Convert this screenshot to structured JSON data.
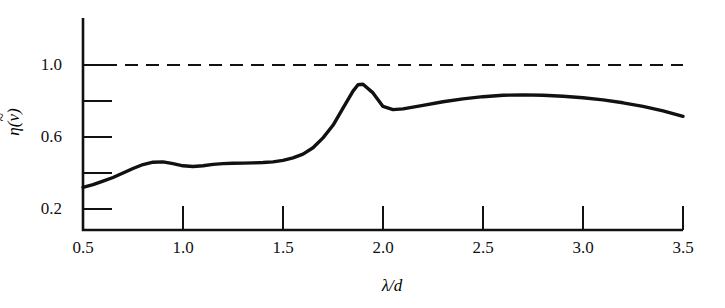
{
  "chart_data": {
    "type": "line",
    "title": "",
    "xlabel": "λ/d",
    "ylabel": "η(ν̃)",
    "xlim": [
      0.5,
      3.5
    ],
    "ylim": [
      0.09,
      1.12
    ],
    "grid": false,
    "legend": null,
    "xticks": [
      0.5,
      1.0,
      1.5,
      2.0,
      2.5,
      3.0,
      3.5
    ],
    "xtick_labels": [
      "0.5",
      "1.0",
      "1.5",
      "2.0",
      "2.5",
      "3.0",
      "3.5"
    ],
    "yticks": [
      0.2,
      0.4,
      0.6,
      0.8,
      1.0
    ],
    "ytick_labels": [
      "0.2",
      "",
      "0.6",
      "",
      "1.0"
    ],
    "ytick_labels_shown": [
      "0.2",
      "0.6",
      "1.0"
    ],
    "series": [
      {
        "name": "efficiency",
        "style": "solid",
        "color": "#111111",
        "x": [
          0.5,
          0.55,
          0.6,
          0.65,
          0.7,
          0.75,
          0.8,
          0.85,
          0.9,
          0.95,
          1.0,
          1.05,
          1.1,
          1.15,
          1.2,
          1.25,
          1.3,
          1.35,
          1.4,
          1.45,
          1.5,
          1.55,
          1.6,
          1.65,
          1.7,
          1.75,
          1.8,
          1.85,
          1.875,
          1.9,
          1.95,
          2.0,
          2.05,
          2.1,
          2.2,
          2.3,
          2.4,
          2.5,
          2.6,
          2.7,
          2.8,
          2.9,
          3.0,
          3.1,
          3.2,
          3.3,
          3.4,
          3.5
        ],
        "y": [
          0.32,
          0.335,
          0.355,
          0.375,
          0.4,
          0.425,
          0.447,
          0.46,
          0.462,
          0.452,
          0.44,
          0.436,
          0.44,
          0.448,
          0.452,
          0.454,
          0.455,
          0.456,
          0.458,
          0.462,
          0.47,
          0.484,
          0.505,
          0.54,
          0.595,
          0.665,
          0.76,
          0.855,
          0.89,
          0.893,
          0.845,
          0.77,
          0.752,
          0.756,
          0.776,
          0.796,
          0.812,
          0.824,
          0.832,
          0.834,
          0.832,
          0.826,
          0.818,
          0.806,
          0.79,
          0.77,
          0.745,
          0.715
        ]
      },
      {
        "name": "unity-reference",
        "style": "dashed",
        "color": "#111111",
        "x": [
          0.5,
          3.5
        ],
        "y": [
          1.0,
          1.0
        ]
      }
    ],
    "annotations": [
      {
        "name": "local-maximum-1",
        "x": 0.88,
        "y": 0.462
      },
      {
        "name": "local-minimum-1",
        "x": 1.05,
        "y": 0.436
      },
      {
        "name": "principal-peak",
        "x": 1.875,
        "y": 0.89
      },
      {
        "name": "local-minimum-2",
        "x": 2.05,
        "y": 0.752
      },
      {
        "name": "broad-maximum",
        "x": 2.68,
        "y": 0.834
      }
    ]
  },
  "axes": {
    "y_title_base": "η(",
    "y_title_nu": "ν",
    "y_title_bar": "~",
    "y_title_close": ")",
    "x_title": "λ/d"
  }
}
